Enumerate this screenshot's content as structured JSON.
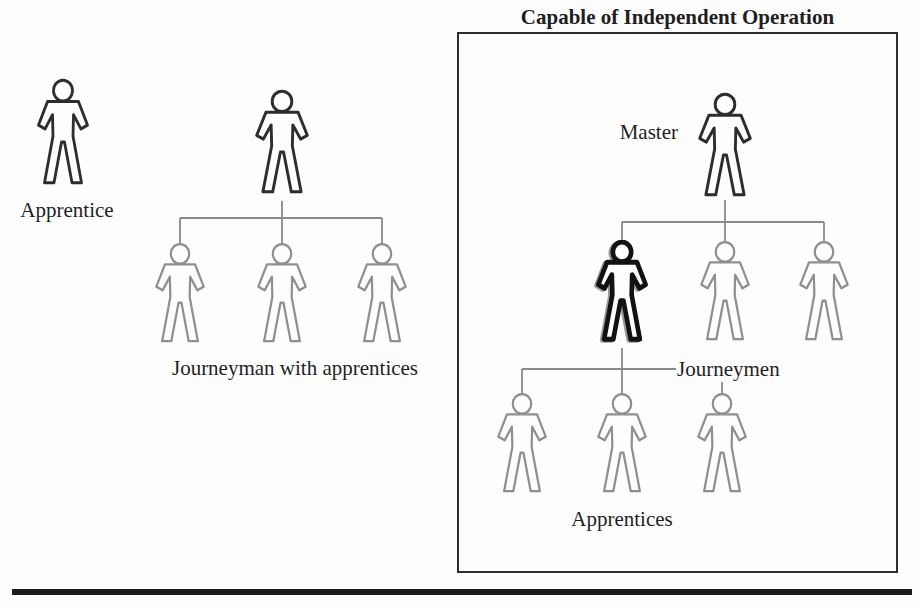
{
  "title": "Capable of Independent Operation",
  "labels": {
    "apprentice": "Apprentice",
    "journeyman_group": "Journeyman with apprentices",
    "master": "Master",
    "journeymen": "Journeymen",
    "apprentices": "Apprentices"
  },
  "colors": {
    "background": "#fdfdfd",
    "text": "#1f1f1f",
    "figure_dark": "#2d2d2d",
    "figure_gray": "#8f8f8f",
    "figure_bold": "#121212",
    "connector": "#8a8a8a",
    "box_border": "#2e2e2e",
    "bottom_rule": "#1c1c1c"
  },
  "diagram": {
    "groups": [
      {
        "id": "single-apprentice",
        "label": "Apprentice",
        "figures": [
          {
            "role": "apprentice",
            "emphasis": "dark"
          }
        ]
      },
      {
        "id": "journeyman-with-apprentices",
        "label": "Journeyman with apprentices",
        "root": {
          "role": "journeyman",
          "emphasis": "dark"
        },
        "children": [
          {
            "role": "apprentice",
            "emphasis": "light"
          },
          {
            "role": "apprentice",
            "emphasis": "light"
          },
          {
            "role": "apprentice",
            "emphasis": "light"
          }
        ]
      },
      {
        "id": "master-shop",
        "box_title": "Capable of Independent Operation",
        "root": {
          "role": "master",
          "emphasis": "dark",
          "label": "Master"
        },
        "level2": {
          "label": "Journeymen",
          "figures": [
            {
              "role": "journeyman",
              "emphasis": "bold"
            },
            {
              "role": "journeyman",
              "emphasis": "light"
            },
            {
              "role": "journeyman",
              "emphasis": "light"
            }
          ]
        },
        "level3": {
          "label": "Apprentices",
          "figures": [
            {
              "role": "apprentice",
              "emphasis": "light"
            },
            {
              "role": "apprentice",
              "emphasis": "light"
            },
            {
              "role": "apprentice",
              "emphasis": "light"
            }
          ]
        }
      }
    ]
  }
}
